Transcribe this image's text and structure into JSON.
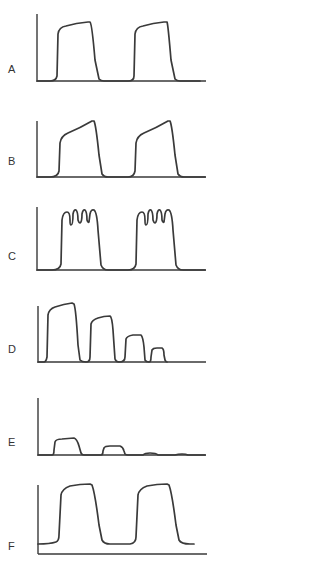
{
  "figure": {
    "panels": [
      {
        "label": "A",
        "shape": "two square-ish plateaus, slight upward slope on top"
      },
      {
        "label": "B",
        "shape": "two plateaus with rounded shoulder rising to a late peak"
      },
      {
        "label": "C",
        "shape": "two plateaus with multiple oscillatory notches on top"
      },
      {
        "label": "D",
        "shape": "four plateaus of progressively decreasing amplitude"
      },
      {
        "label": "E",
        "shape": "four small plateaus of rapidly decreasing amplitude"
      },
      {
        "label": "F",
        "shape": "two plateaus with elevated baseline"
      }
    ]
  },
  "colors": {
    "line": "#3a3a3a",
    "background": "#ffffff",
    "label": "#333333"
  }
}
